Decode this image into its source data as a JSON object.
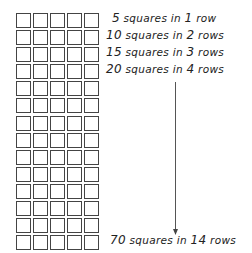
{
  "grid": {
    "columns": 5,
    "rows": 14,
    "total": 70
  },
  "labels": [
    {
      "count": "5",
      "mid": " squares in ",
      "rows": "1",
      "unit": " row",
      "top": 11
    },
    {
      "count": "10",
      "mid": " squares in ",
      "rows": "2",
      "unit": " rows",
      "top": 28
    },
    {
      "count": "15",
      "mid": " squares in ",
      "rows": "3",
      "unit": " rows",
      "top": 45
    },
    {
      "count": "20",
      "mid": " squares in ",
      "rows": "4",
      "unit": " rows",
      "top": 62
    },
    {
      "count": "70",
      "mid": " squares in ",
      "rows": "14",
      "unit": " rows",
      "top": 233
    }
  ],
  "arrow": {
    "x": 175,
    "y1": 82,
    "y2": 234,
    "color": "#555555"
  }
}
